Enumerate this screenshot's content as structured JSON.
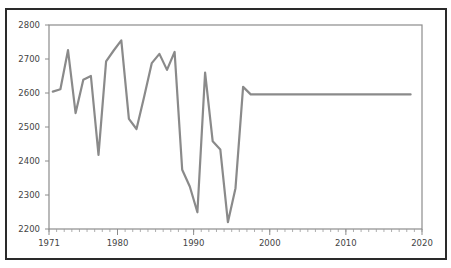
{
  "chart_data": {
    "type": "line",
    "title": "",
    "xlabel": "",
    "ylabel": "",
    "xlim": [
      1971,
      2020
    ],
    "ylim": [
      2200,
      2800
    ],
    "x_ticks": [
      1971,
      1980,
      1990,
      2000,
      2010,
      2020
    ],
    "y_ticks": [
      2200,
      2300,
      2400,
      2500,
      2600,
      2700,
      2800
    ],
    "grid": false,
    "legend": null,
    "series": [
      {
        "name": "series-1",
        "color": "#8a8a8a",
        "x": [
          1972,
          1973,
          1974,
          1975,
          1976,
          1977,
          1978,
          1979,
          1980,
          1981,
          1982,
          1983,
          1984,
          1985,
          1986,
          1987,
          1988,
          1989,
          1990,
          1991,
          1992,
          1993,
          1994,
          1995,
          1996,
          1997,
          1998,
          1999,
          2000,
          2001,
          2002,
          2003,
          2004,
          2005,
          2006,
          2007,
          2008,
          2009,
          2010,
          2011,
          2012,
          2013,
          2014,
          2015,
          2016,
          2017,
          2018,
          2019
        ],
        "values": [
          2604,
          2611,
          2726,
          2541,
          2639,
          2650,
          2418,
          2693,
          2725,
          2755,
          2524,
          2494,
          2590,
          2688,
          2715,
          2668,
          2721,
          2374,
          2325,
          2249,
          2660,
          2458,
          2434,
          2220,
          2320,
          2618,
          2596,
          2596,
          2596,
          2596,
          2596,
          2596,
          2596,
          2596,
          2596,
          2596,
          2596,
          2596,
          2596,
          2596,
          2596,
          2596,
          2596,
          2596,
          2596,
          2596,
          2596,
          2596
        ]
      }
    ]
  },
  "plot": {
    "left": 49,
    "right": 422,
    "top": 25,
    "bottom": 229,
    "x_offset_years": 0.5
  }
}
